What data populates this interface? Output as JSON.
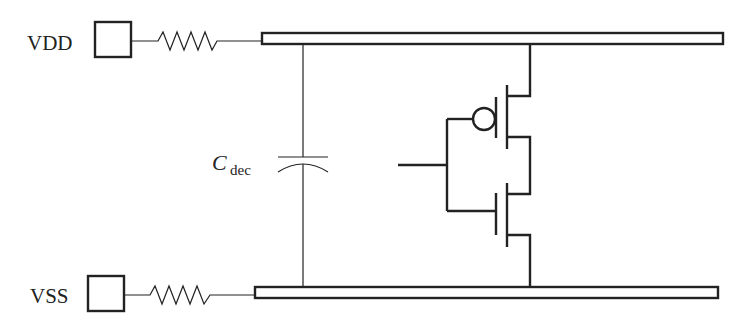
{
  "diagram": {
    "type": "circuit-schematic",
    "labels": {
      "vdd": "VDD",
      "vss": "VSS",
      "cdec_main": "C",
      "cdec_sub": "dec"
    },
    "components": [
      {
        "id": "vdd-pad",
        "kind": "pad",
        "label": "VDD"
      },
      {
        "id": "vdd-resistor",
        "kind": "resistor"
      },
      {
        "id": "vdd-rail",
        "kind": "power-rail"
      },
      {
        "id": "vss-pad",
        "kind": "pad",
        "label": "VSS"
      },
      {
        "id": "vss-resistor",
        "kind": "resistor"
      },
      {
        "id": "vss-rail",
        "kind": "ground-rail"
      },
      {
        "id": "decap",
        "kind": "capacitor",
        "label": "Cdec"
      },
      {
        "id": "pmos",
        "kind": "pmos-transistor"
      },
      {
        "id": "nmos",
        "kind": "nmos-transistor"
      }
    ],
    "colors": {
      "stroke": "#222222",
      "background": "#ffffff"
    }
  }
}
